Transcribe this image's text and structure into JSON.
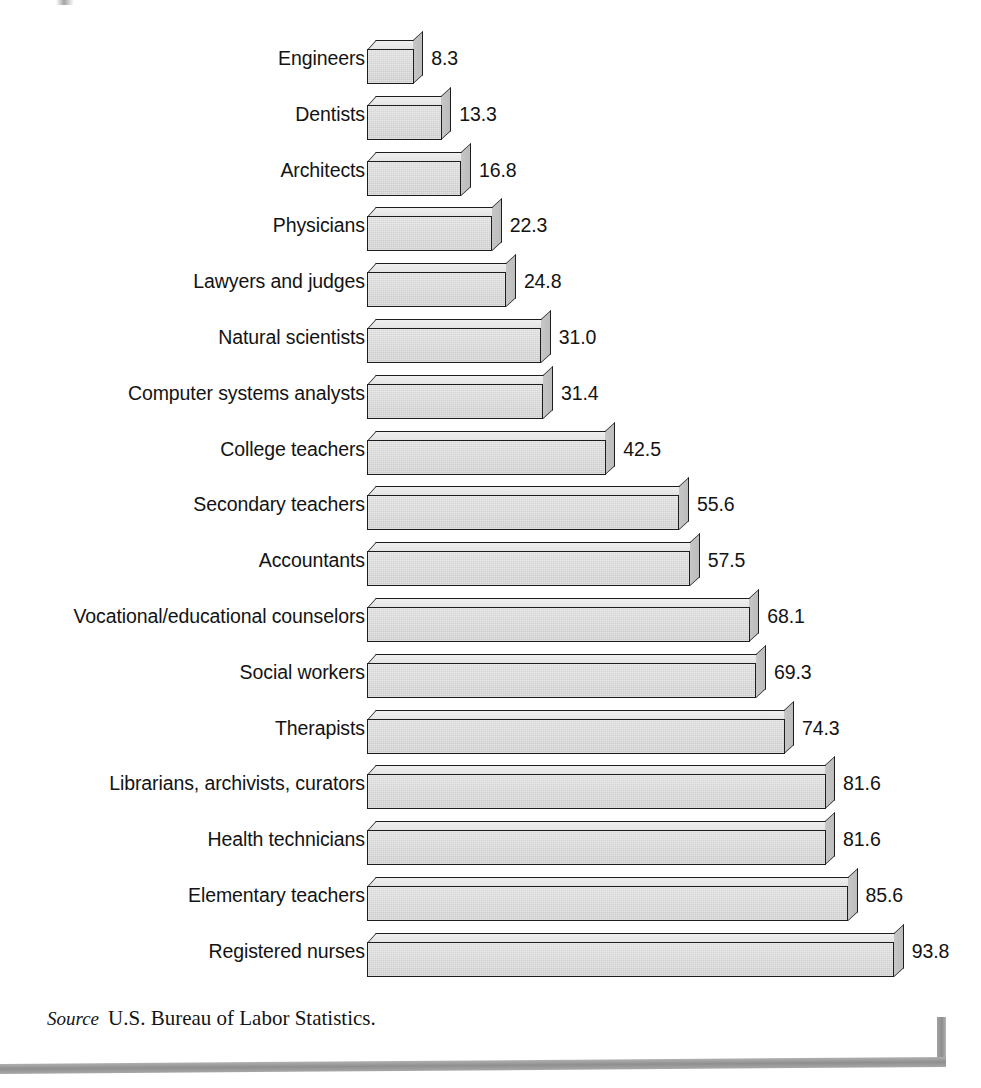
{
  "chart_data": {
    "type": "bar",
    "orientation": "horizontal",
    "title": "",
    "subtitle": "",
    "xlabel": "",
    "ylabel": "",
    "grid": false,
    "legend": null,
    "value_format": "one decimal",
    "xlim": [
      0,
      93.8
    ],
    "categories": [
      "Engineers",
      "Dentists",
      "Architects",
      "Physicians",
      "Lawyers and judges",
      "Natural scientists",
      "Computer systems analysts",
      "College teachers",
      "Secondary teachers",
      "Accountants",
      "Vocational/educational counselors",
      "Social workers",
      "Therapists",
      "Librarians, archivists, curators",
      "Health technicians",
      "Elementary teachers",
      "Registered nurses"
    ],
    "values": [
      8.3,
      13.3,
      16.8,
      22.3,
      24.8,
      31.0,
      31.4,
      42.5,
      55.6,
      57.5,
      68.1,
      69.3,
      74.3,
      81.6,
      81.6,
      85.6,
      93.8
    ],
    "value_labels": [
      "8.3",
      "13.3",
      "16.8",
      "22.3",
      "24.8",
      "31.0",
      "31.4",
      "42.5",
      "55.6",
      "57.5",
      "68.1",
      "69.3",
      "74.3",
      "81.6",
      "81.6",
      "85.6",
      "93.8"
    ],
    "annotations": []
  },
  "source": {
    "label": "Source",
    "text": "U.S. Bureau of Labor Statistics."
  },
  "colors": {
    "bar_front": "#d2d2d2",
    "bar_top": "#e8e8e8",
    "bar_side": "#c2c2c2",
    "bar_outline": "#1d1d1d",
    "text": "#131313",
    "rule": "#9a9a9a",
    "background": "#ffffff"
  }
}
